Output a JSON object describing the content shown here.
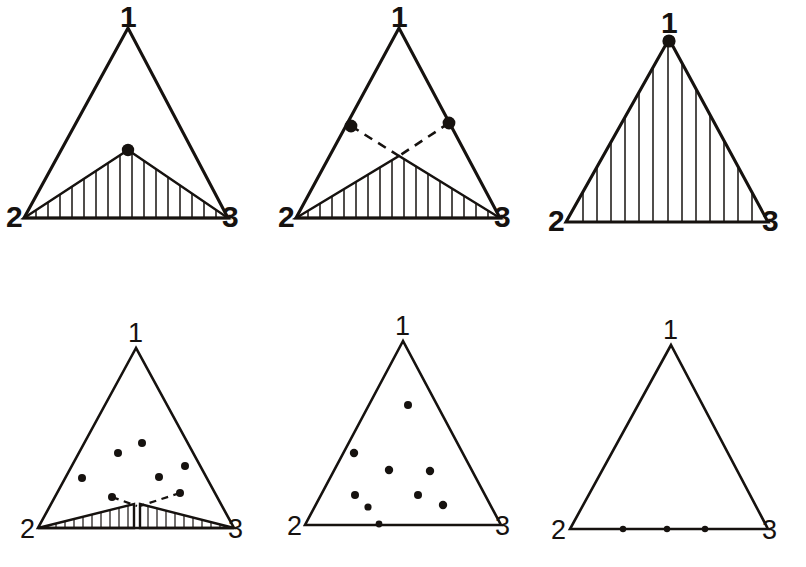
{
  "figure": {
    "background_color": "#ffffff",
    "ink_color": "#16120f",
    "canvas": {
      "width": 806,
      "height": 567
    },
    "vertex_label_names": [
      "1",
      "2",
      "3"
    ]
  },
  "panels": [
    {
      "id": "panel-top-left",
      "row": 0,
      "column": 0,
      "triangle": {
        "apex": [
          128,
          28
        ],
        "left": [
          24,
          218
        ],
        "right": [
          228,
          218
        ]
      },
      "labels": {
        "apex": {
          "text": "1",
          "x": 120,
          "y": 2
        },
        "left": {
          "text": "2",
          "x": 6,
          "y": 206
        },
        "right": {
          "text": "3",
          "x": 222,
          "y": 206
        }
      },
      "hatched_region": {
        "kind": "single-peak",
        "points": [
          [
            24,
            218
          ],
          [
            128,
            150
          ],
          [
            228,
            218
          ]
        ],
        "hatch_count": 17
      },
      "node_dots": [
        {
          "x": 128,
          "y": 150,
          "r": 6.2
        }
      ],
      "dashed_lines": [],
      "sample_dots": [],
      "base_dots": []
    },
    {
      "id": "panel-top-middle",
      "row": 0,
      "column": 1,
      "triangle": {
        "apex": [
          399,
          28
        ],
        "left": [
          296,
          218
        ],
        "right": [
          500,
          218
        ]
      },
      "labels": {
        "apex": {
          "text": "1",
          "x": 391,
          "y": 2
        },
        "left": {
          "text": "2",
          "x": 278,
          "y": 206
        },
        "right": {
          "text": "3",
          "x": 494,
          "y": 206
        }
      },
      "hatched_region": {
        "kind": "single-peak",
        "points": [
          [
            296,
            218
          ],
          [
            399,
            156
          ],
          [
            500,
            218
          ]
        ],
        "hatch_count": 17
      },
      "node_dots": [
        {
          "x": 351,
          "y": 126,
          "r": 6.4
        },
        {
          "x": 449,
          "y": 123,
          "r": 6.4
        }
      ],
      "dashed_lines": [
        {
          "from": [
            351,
            126
          ],
          "to": [
            399,
            156
          ]
        },
        {
          "from": [
            449,
            123
          ],
          "to": [
            399,
            156
          ]
        }
      ],
      "sample_dots": [],
      "base_dots": []
    },
    {
      "id": "panel-top-right",
      "row": 0,
      "column": 2,
      "triangle": {
        "apex": [
          669,
          39
        ],
        "left": [
          566,
          222
        ],
        "right": [
          768,
          222
        ]
      },
      "labels": {
        "apex": {
          "text": "1",
          "x": 661,
          "y": 4
        },
        "left": {
          "text": "2",
          "x": 548,
          "y": 210
        },
        "right": {
          "text": "3",
          "x": 762,
          "y": 210
        }
      },
      "hatched_region": {
        "kind": "full-triangle",
        "points": [
          [
            566,
            222
          ],
          [
            669,
            39
          ],
          [
            768,
            222
          ]
        ],
        "hatch_count": 13
      },
      "node_dots": [
        {
          "x": 669,
          "y": 41,
          "r": 6.6
        }
      ],
      "dashed_lines": [],
      "sample_dots": [],
      "base_dots": []
    },
    {
      "id": "panel-bottom-left",
      "row": 1,
      "column": 0,
      "triangle": {
        "apex": [
          136,
          348
        ],
        "left": [
          38,
          528
        ],
        "right": [
          234,
          528
        ]
      },
      "labels": {
        "apex": {
          "text": "1",
          "x": 128,
          "y": 320
        },
        "left": {
          "text": "2",
          "x": 20,
          "y": 518
        },
        "right": {
          "text": "3",
          "x": 228,
          "y": 518
        }
      },
      "hatched_region": {
        "kind": "double-peak",
        "left_wedge": [
          [
            38,
            528
          ],
          [
            134,
            505
          ],
          [
            134,
            528
          ]
        ],
        "right_wedge": [
          [
            140,
            505
          ],
          [
            234,
            528
          ],
          [
            140,
            528
          ]
        ],
        "hatch_count_left": 10,
        "hatch_count_right": 11
      },
      "node_dots": [],
      "dashed_lines": [
        {
          "from": [
            112,
            497
          ],
          "to": [
            137,
            506
          ]
        },
        {
          "from": [
            180,
            493
          ],
          "to": [
            140,
            506
          ]
        }
      ],
      "sample_dots": [
        {
          "x": 142,
          "y": 443
        },
        {
          "x": 118,
          "y": 453
        },
        {
          "x": 185,
          "y": 466
        },
        {
          "x": 159,
          "y": 477
        },
        {
          "x": 82,
          "y": 478
        },
        {
          "x": 112,
          "y": 497
        },
        {
          "x": 180,
          "y": 493
        }
      ],
      "base_dots": []
    },
    {
      "id": "panel-bottom-middle",
      "row": 1,
      "column": 1,
      "triangle": {
        "apex": [
          403,
          341
        ],
        "left": [
          305,
          525
        ],
        "right": [
          501,
          525
        ]
      },
      "labels": {
        "apex": {
          "text": "1",
          "x": 395,
          "y": 313
        },
        "left": {
          "text": "2",
          "x": 287,
          "y": 515
        },
        "right": {
          "text": "3",
          "x": 495,
          "y": 515
        }
      },
      "hatched_region": null,
      "node_dots": [],
      "dashed_lines": [],
      "sample_dots": [
        {
          "x": 408,
          "y": 405
        },
        {
          "x": 354,
          "y": 453
        },
        {
          "x": 389,
          "y": 470
        },
        {
          "x": 430,
          "y": 471
        },
        {
          "x": 355,
          "y": 495
        },
        {
          "x": 418,
          "y": 495
        },
        {
          "x": 368,
          "y": 507
        },
        {
          "x": 443,
          "y": 505
        }
      ],
      "base_dots": [
        {
          "x": 379,
          "y": 524
        }
      ]
    },
    {
      "id": "panel-bottom-right",
      "row": 1,
      "column": 2,
      "triangle": {
        "apex": [
          671,
          345
        ],
        "left": [
          570,
          529
        ],
        "right": [
          768,
          529
        ]
      },
      "labels": {
        "apex": {
          "text": "1",
          "x": 663,
          "y": 317
        },
        "left": {
          "text": "2",
          "x": 551,
          "y": 519
        },
        "right": {
          "text": "3",
          "x": 762,
          "y": 519
        }
      },
      "hatched_region": null,
      "node_dots": [],
      "dashed_lines": [],
      "sample_dots": [],
      "base_dots": [
        {
          "x": 623,
          "y": 529
        },
        {
          "x": 667,
          "y": 529
        },
        {
          "x": 705,
          "y": 529
        }
      ]
    }
  ]
}
